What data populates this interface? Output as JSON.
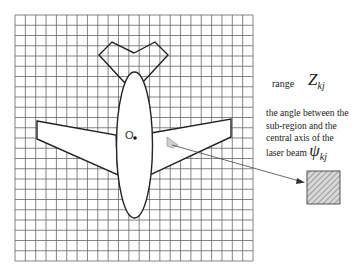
{
  "diagram": {
    "origin_label": "O",
    "range_label": "range",
    "range_symbol": "Z",
    "range_subscript": "kj",
    "angle_text_lines": [
      "the angle between the",
      "sub-region and the",
      "central axis of the",
      "laser beam"
    ],
    "angle_symbol": "ψ",
    "angle_subscript": "kj",
    "grid": {
      "x0": 15,
      "y0": 15,
      "x1": 253,
      "y1": 261,
      "cols": 23,
      "rows": 24
    },
    "colors": {
      "grid": "#555555",
      "outline": "#222222",
      "hatch": "#9a9a9a"
    }
  }
}
